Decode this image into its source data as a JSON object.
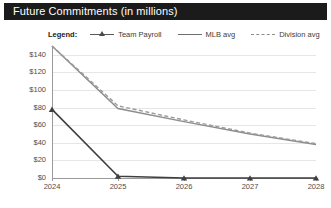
{
  "header": {
    "title": "Future Commitments (in millions)"
  },
  "legend": {
    "title_label": "Legend:",
    "entries": [
      {
        "label": "Team Payroll",
        "style": "line-marker",
        "color": "#4a4a4a"
      },
      {
        "label": "MLB avg",
        "style": "solid",
        "color": "#8c8c8c"
      },
      {
        "label": "Division avg",
        "style": "dashed",
        "color": "#9a9a9a"
      }
    ]
  },
  "chart_data": {
    "type": "line",
    "title": "Future Commitments (in millions)",
    "xlabel": "",
    "ylabel": "",
    "x": [
      "2024",
      "2025",
      "2026",
      "2027",
      "2028"
    ],
    "categories": [
      "2024",
      "2025",
      "2026",
      "2027",
      "2028"
    ],
    "yticks": [
      "$0",
      "$20",
      "$40",
      "$60",
      "$80",
      "$100",
      "$120",
      "$140"
    ],
    "ytick_values": [
      0,
      20,
      40,
      60,
      80,
      100,
      120,
      140
    ],
    "ylim": [
      0,
      150
    ],
    "grid": true,
    "legend_position": "top",
    "series": [
      {
        "name": "Team Payroll",
        "values": [
          78,
          2,
          0,
          0,
          0
        ],
        "color": "#3f3f3f",
        "style": "solid",
        "marker": "triangle"
      },
      {
        "name": "MLB avg",
        "values": [
          150,
          79,
          64,
          50,
          38
        ],
        "color": "#8c8c8c",
        "style": "solid",
        "marker": "none"
      },
      {
        "name": "Division avg",
        "values": [
          150,
          82,
          66,
          51,
          39
        ],
        "color": "#9a9a9a",
        "style": "dashed",
        "marker": "none"
      }
    ]
  }
}
